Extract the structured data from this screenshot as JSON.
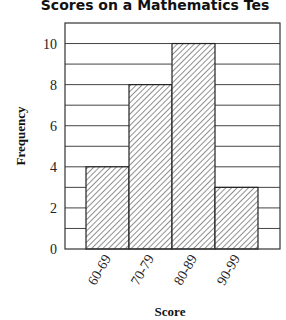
{
  "chart_data": {
    "type": "bar",
    "xlabel": "Score",
    "ylabel": "Frequency",
    "categories": [
      "60-69",
      "70-79",
      "80-89",
      "90-99"
    ],
    "values": [
      4,
      8,
      10,
      3
    ],
    "ylim": [
      0,
      11
    ],
    "yticks": [
      0,
      2,
      4,
      6,
      8,
      10
    ],
    "grid": "horizontal, every 1 unit",
    "bar_fill": "diagonal hatch",
    "legend": null
  },
  "labels": {
    "title": "Scores on a Mathematics Tes",
    "xlabel": "Score",
    "ylabel": "Frequency"
  }
}
